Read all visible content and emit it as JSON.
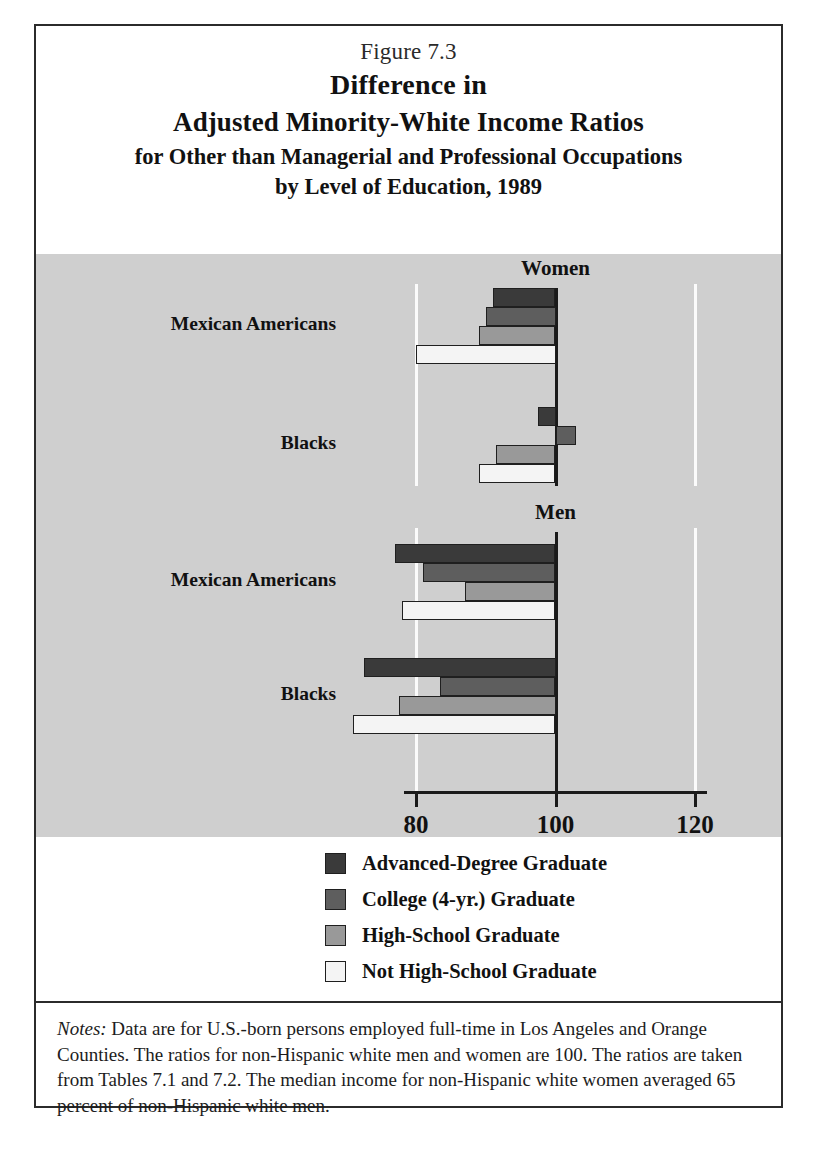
{
  "figure": {
    "number": "Figure 7.3",
    "title_line_1": "Difference in",
    "title_line_2": "Adjusted Minority-White Income Ratios",
    "title_line_3": "for Other than Managerial and Professional Occupations",
    "title_line_4": "by Level of Education, 1989"
  },
  "panels": [
    {
      "header": "Women"
    },
    {
      "header": "Men"
    }
  ],
  "category_labels": {
    "mexican_americans": "Mexican Americans",
    "blacks": "Blacks"
  },
  "axis": {
    "ticks": [
      "80",
      "100",
      "120"
    ],
    "tick_values": [
      80,
      100,
      120
    ],
    "min": 72,
    "max": 126
  },
  "legend": {
    "items": [
      {
        "label": "Advanced-Degree Graduate",
        "color": "#3a3a3a"
      },
      {
        "label": "College (4-yr.) Graduate",
        "color": "#5e5e5e"
      },
      {
        "label": "High-School Graduate",
        "color": "#999999"
      },
      {
        "label": "Not High-School Graduate",
        "color": "#f4f4f4"
      }
    ]
  },
  "notes": {
    "label": "Notes:",
    "text": " Data are for U.S.-born persons employed full-time in Los Angeles and Orange Counties. The ratios for non-Hispanic white men and women are 100. The ratios are taken from Tables 7.1 and 7.2. The median income for non-Hispanic white women averaged 65 percent of non-Hispanic white men."
  },
  "colors": {
    "panel_background": "#cfcfcf",
    "page_background": "#ffffff",
    "ink": "#1a1a1a",
    "gridline": "#fbfbfb"
  },
  "chart_data": {
    "type": "bar",
    "orientation": "horizontal",
    "title": "Difference in Adjusted Minority-White Income Ratios for Other than Managerial and Professional Occupations by Level of Education, 1989",
    "xlabel": "",
    "ylabel": "",
    "xlim": [
      72,
      126
    ],
    "reference_value": 100,
    "xticks": [
      80,
      100,
      120
    ],
    "grid": true,
    "legend_position": "bottom",
    "series": [
      {
        "name": "Advanced-Degree Graduate",
        "color": "#3a3a3a"
      },
      {
        "name": "College (4-yr.) Graduate",
        "color": "#5e5e5e"
      },
      {
        "name": "High-School Graduate",
        "color": "#999999"
      },
      {
        "name": "Not High-School Graduate",
        "color": "#f4f4f4"
      }
    ],
    "groups": [
      {
        "panel": "Women",
        "category": "Mexican Americans",
        "values": [
          91,
          90,
          89,
          80
        ]
      },
      {
        "panel": "Women",
        "category": "Blacks",
        "values": [
          97.5,
          103,
          91.5,
          89
        ]
      },
      {
        "panel": "Men",
        "category": "Mexican Americans",
        "values": [
          77,
          81,
          87,
          78
        ]
      },
      {
        "panel": "Men",
        "category": "Blacks",
        "values": [
          72.5,
          83.5,
          77.5,
          71
        ]
      }
    ],
    "notes": "Data are for U.S.-born persons employed full-time in Los Angeles and Orange Counties. The ratios for non-Hispanic white men and women are 100. The ratios are taken from Tables 7.1 and 7.2. The median income for non-Hispanic white women averaged 65 percent of non-Hispanic white men."
  }
}
